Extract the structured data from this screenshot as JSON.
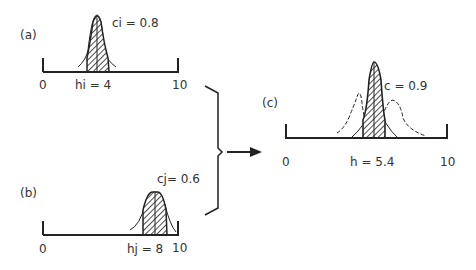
{
  "panels": {
    "a": {
      "label": "(a)",
      "confidence_label": "ci = 0.8",
      "peak_label": "hi = 4",
      "axis_min": "0",
      "axis_max": "10",
      "peak": 4,
      "confidence": 0.8
    },
    "b": {
      "label": "(b)",
      "confidence_label": "cj= 0.6",
      "peak_label": "hj = 8",
      "axis_min": "0",
      "axis_max": "10",
      "peak": 8,
      "confidence": 0.6
    },
    "c": {
      "label": "(c)",
      "confidence_label": "c = 0.9",
      "peak_label": "h = 5.4",
      "axis_min": "0",
      "axis_max": "10",
      "peak": 5.4,
      "confidence": 0.9
    }
  },
  "colors": {
    "ink": "#222222",
    "background": "#ffffff"
  }
}
